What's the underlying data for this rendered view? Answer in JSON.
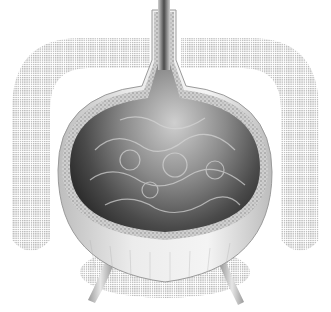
{
  "image": {
    "subject": "bladder cross-section illustration",
    "width": 331,
    "height": 312,
    "colors": {
      "background": "#ffffff",
      "halftone": "#b8b8b8",
      "wall_outer": "#d9d9d9",
      "wall_texture": "#9a9a9a",
      "lumen_dark": "#3c3c3c",
      "lumen_mid": "#7a7a7a",
      "lumen_light": "#c8c8c8",
      "ureter": "#c0c0c0"
    }
  }
}
